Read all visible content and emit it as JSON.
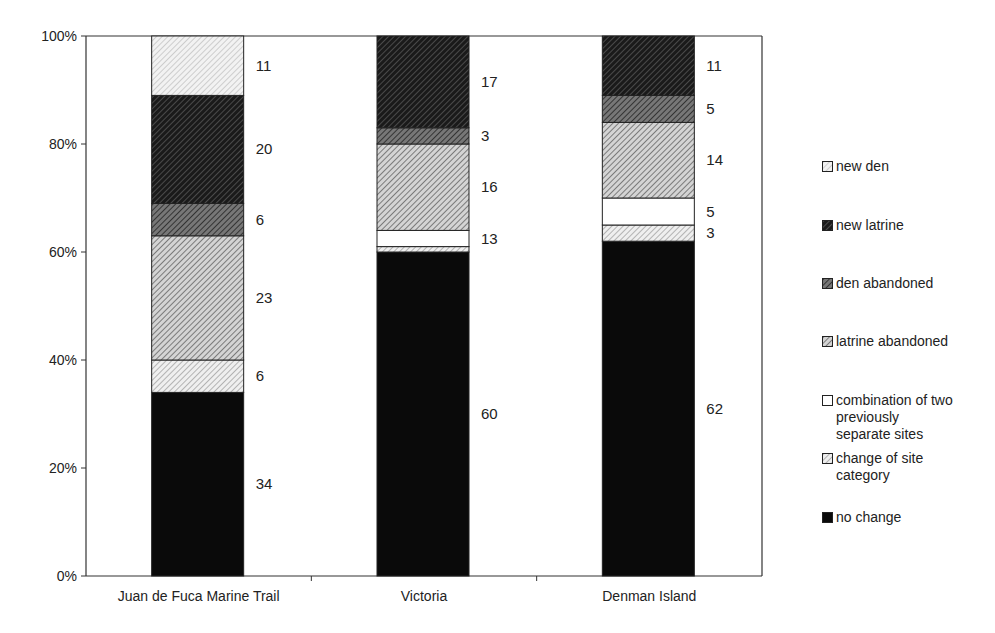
{
  "chart_data": {
    "type": "bar",
    "stacked": true,
    "percent_stacked": true,
    "title": "",
    "xlabel": "",
    "ylabel": "",
    "ylim": [
      0,
      100
    ],
    "y_ticks": [
      "0%",
      "20%",
      "40%",
      "60%",
      "80%",
      "100%"
    ],
    "grid": false,
    "legend_position": "right",
    "categories": [
      "Juan de Fuca Marine Trail",
      "Victoria",
      "Denman Island"
    ],
    "series": [
      {
        "name": "no change",
        "values": [
          34,
          60,
          62
        ],
        "labels": [
          "34",
          "60",
          "62"
        ]
      },
      {
        "name": "change of site category",
        "values": [
          6,
          1,
          3
        ],
        "labels": [
          "6",
          "",
          "3"
        ]
      },
      {
        "name": "combination of two previously separate sites",
        "values": [
          0,
          3,
          5
        ],
        "labels": [
          "",
          "13",
          "5"
        ]
      },
      {
        "name": "latrine abandoned",
        "values": [
          23,
          16,
          14
        ],
        "labels": [
          "23",
          "16",
          "14"
        ]
      },
      {
        "name": "den abandoned",
        "values": [
          6,
          3,
          5
        ],
        "labels": [
          "6",
          "3",
          "5"
        ]
      },
      {
        "name": "new latrine",
        "values": [
          20,
          17,
          11
        ],
        "labels": [
          "20",
          "17",
          "11"
        ]
      },
      {
        "name": "new den",
        "values": [
          11,
          0,
          0
        ],
        "labels": [
          "11",
          "",
          ""
        ]
      }
    ]
  },
  "legend": {
    "items": [
      {
        "label": "new den",
        "key": "new_den"
      },
      {
        "label": "new latrine",
        "key": "new_latrine"
      },
      {
        "label": "den abandoned",
        "key": "den_abandoned"
      },
      {
        "label": "latrine abandoned",
        "key": "latrine_abandoned"
      },
      {
        "label": "combination of two\npreviously\nseparate sites",
        "key": "combination"
      },
      {
        "label": "change of site\ncategory",
        "key": "change_category"
      },
      {
        "label": "no change",
        "key": "no_change"
      }
    ]
  }
}
